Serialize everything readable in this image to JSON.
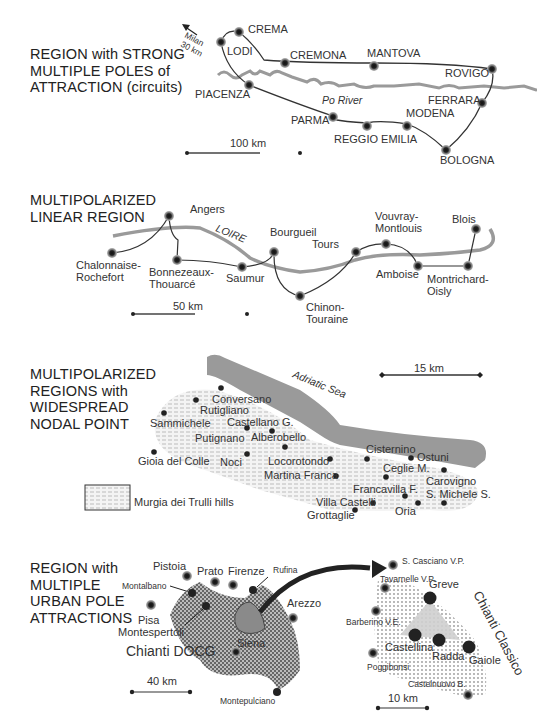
{
  "panels": [
    {
      "id": "circuits",
      "title_lines": [
        "REGION with STRONG",
        "MULTIPLE POLES of",
        "ATTRACTION (circuits)"
      ],
      "direction_label": [
        "Milan",
        "30 km"
      ],
      "river_label": "Po River",
      "scale_label": "100 km",
      "cities": [
        "CREMA",
        "LODI",
        "CREMONA",
        "MANTOVA",
        "ROVIGO",
        "PIACENZA",
        "FERRARA",
        "PARMA",
        "MODENA",
        "REGGIO EMILIA",
        "BOLOGNA"
      ]
    },
    {
      "id": "linear",
      "title_lines": [
        "MULTIPOLARIZED",
        "LINEAR REGION"
      ],
      "river_label": "LOIRE",
      "scale_label": "50 km",
      "cities": [
        "Angers",
        "Chalonnaise-",
        "Rochefort",
        "Bonnezeaux-",
        "Thouarcé",
        "Saumur",
        "Bourgueil",
        "Chinon-",
        "Touraine",
        "Tours",
        "Vouvray-",
        "Montlouis",
        "Amboise",
        "Blois",
        "Montrichard-",
        "Oisly"
      ]
    },
    {
      "id": "nodal",
      "title_lines": [
        "MULTIPOLARIZED",
        "REGIONS with",
        "WIDESPREAD",
        "NODAL POINT"
      ],
      "sea_label": "Adriatic Sea",
      "scale_label": "15 km",
      "legend_label": "Murgia dei Trulli hills",
      "cities": [
        "Conversano",
        "Rutigliano",
        "Sammichele",
        "Castellano G.",
        "Putignano",
        "Alberobello",
        "Gioia del Colle",
        "Noci",
        "Locorotondo",
        "Martina Franca",
        "Cisternino",
        "Ostuni",
        "Ceglie M.",
        "Carovigno",
        "Francavilla F.",
        "S. Michele S.",
        "Villa Castelli",
        "Oria",
        "Grottaglie"
      ]
    },
    {
      "id": "urban",
      "title_lines": [
        "REGION with",
        "MULTIPLE",
        "URBAN POLE",
        "ATTRACTIONS"
      ],
      "left_area_label": "Chianti DOCG",
      "right_area_label": "Chianti Classico",
      "scale_left": "40 km",
      "scale_right": "10 km",
      "cities_left": [
        "Pistoia",
        "Prato",
        "Firenze",
        "Rufina",
        "Montalbano",
        "Pisa",
        "Montespertoli",
        "Arezzo",
        "Siena",
        "Montepulciano"
      ],
      "cities_right": [
        "S. Casciano V.P.",
        "Tavarnelle V.P.",
        "Greve",
        "Barberino V.E.",
        "Castellina",
        "Radda",
        "Gaiole",
        "Poggibonsi",
        "Castelnuovo B."
      ]
    }
  ]
}
